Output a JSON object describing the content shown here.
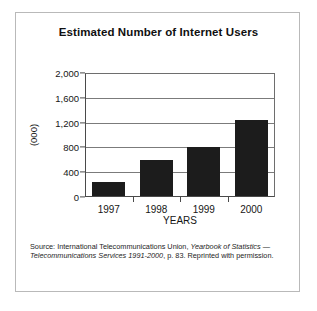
{
  "figure": {
    "title": "Estimated Number of Internet Users",
    "ylabel": "(000)",
    "xlabel": "YEARS",
    "source": {
      "prefix": "Source: International Telecommunications Union, ",
      "italic1": "Yearbook of Statistics",
      "middle": " — ",
      "italic2": "Telecommunications Services 1991-2000",
      "suffix": ", p. 83. Reprinted with permission."
    }
  },
  "chart_data": {
    "type": "bar",
    "title": "Estimated Number of Internet Users",
    "xlabel": "YEARS",
    "ylabel": "(000)",
    "categories": [
      "1997",
      "1998",
      "1999",
      "2000"
    ],
    "values": [
      250,
      600,
      800,
      1250
    ],
    "ylim": [
      0,
      2000
    ],
    "yticks": [
      0,
      400,
      800,
      1200,
      1600,
      2000
    ],
    "ytick_labels": [
      "0",
      "400",
      "800",
      "1,200",
      "1,600",
      "2,000"
    ],
    "grid": "horizontal",
    "legend": "none",
    "bar_color": "#1c1c1c"
  }
}
